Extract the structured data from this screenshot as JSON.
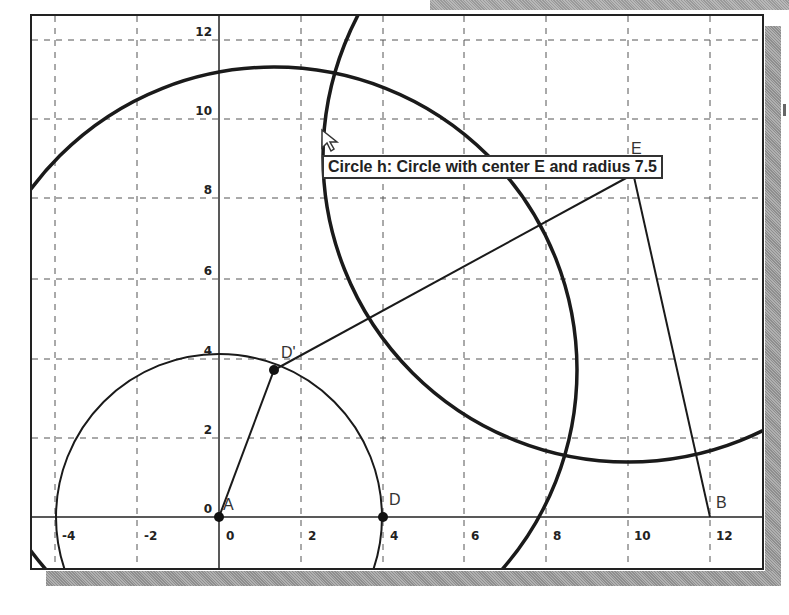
{
  "axes": {
    "x_ticks": [
      "-4",
      "-2",
      "0",
      "2",
      "4",
      "6",
      "8",
      "10",
      "12"
    ],
    "y_ticks": [
      "12",
      "10",
      "8",
      "6",
      "4",
      "2",
      "0"
    ]
  },
  "points": {
    "A": "A",
    "D": "D",
    "D_prime": "D'",
    "E": "E",
    "B": "B"
  },
  "tooltip": {
    "text": "Circle h: Circle with center E and radius 7.5"
  },
  "colors": {
    "line": "#1a1a1a",
    "grid": "#555555",
    "background": "#ffffff"
  }
}
